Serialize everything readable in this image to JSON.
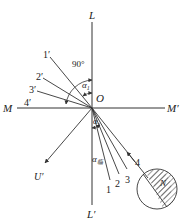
{
  "diagram": {
    "axes": {
      "vertical_top": "L",
      "vertical_bottom": "L′",
      "horizontal_left": "M",
      "horizontal_right": "M′",
      "origin": "O"
    },
    "reflected_rays": [
      "1′",
      "2′",
      "3′",
      "4′"
    ],
    "incident_rays": [
      "1",
      "2",
      "3",
      "4"
    ],
    "angle_labels": {
      "right_angle": "90°",
      "alpha1": "α",
      "alpha1_sub": "1",
      "alpha_lower": "α",
      "alpha_lower_sub": "2",
      "alpha_crit": "α",
      "alpha_crit_sub": "临"
    },
    "other_ray": "U′",
    "medium_symbol": "N",
    "colors": {
      "line": "#333333",
      "text": "#222222",
      "hatch": "#444444"
    }
  }
}
